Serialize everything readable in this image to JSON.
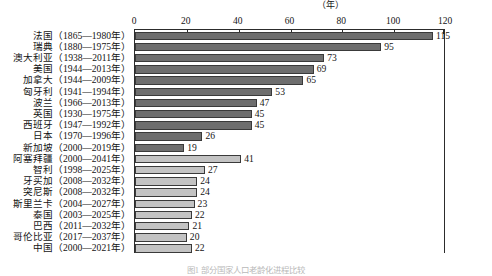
{
  "chart_data": {
    "type": "bar",
    "orientation": "horizontal",
    "title": "",
    "xlabel": "",
    "ylabel": "",
    "unit_label": "（年）",
    "xlim": [
      0,
      120
    ],
    "grid": false,
    "legend": "none",
    "axis_ticks": [
      0,
      20,
      40,
      60,
      80,
      100,
      120
    ],
    "categories": [
      "法国（1865—1980年）",
      "瑞典（1880—1975年）",
      "澳大利亚（1938—2011年）",
      "美国（1944—2013年）",
      "加拿大（1944—2009年）",
      "匈牙利（1941—1994年）",
      "波兰（1966—2013年）",
      "英国（1930—1975年）",
      "西班牙（1947—1992年）",
      "日本（1970—1996年）",
      "新加坡（2000—2019年）",
      "阿塞拜疆（2000—2041年）",
      "智利（1998—2025年）",
      "牙买加（2008—2032年）",
      "突尼斯（2008—2032年）",
      "斯里兰卡（2004—2027年）",
      "泰国（2003—2025年）",
      "巴西（2011—2032年）",
      "哥伦比亚（2017—2037年）",
      "中国（2000—2021年）"
    ],
    "values": [
      115,
      95,
      73,
      69,
      65,
      53,
      47,
      45,
      45,
      26,
      19,
      41,
      27,
      24,
      24,
      23,
      22,
      21,
      20,
      22
    ],
    "series_groups": [
      {
        "name": "已完成",
        "color": "#6e6e6e",
        "indices": [
          0,
          1,
          2,
          3,
          4,
          5,
          6,
          7,
          8,
          9,
          10
        ]
      },
      {
        "name": "预测",
        "color": "#c3c3c3",
        "indices": [
          11,
          12,
          13,
          14,
          15,
          16,
          17,
          18,
          19
        ]
      }
    ],
    "colors": {
      "dark_bar": "#6e6e6e",
      "light_bar": "#c3c3c3",
      "bar_border": "#3a3a3a",
      "axis": "#2c2c2c"
    }
  },
  "caption": "图1 部分国家人口老龄化进程比较"
}
